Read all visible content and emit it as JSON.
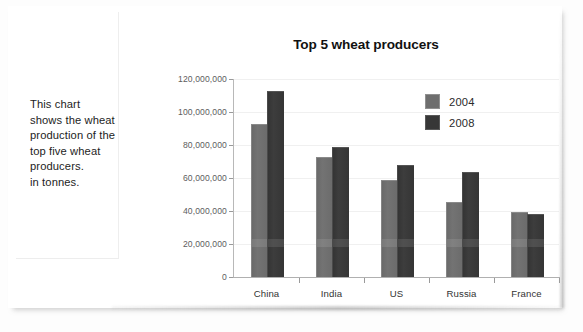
{
  "caption": {
    "text": "This chart\nshows the wheat\nproduction of the\ntop five wheat\nproducers.\nin tonnes."
  },
  "chart_data": {
    "type": "bar",
    "title": "Top 5 wheat producers",
    "xlabel": "",
    "ylabel": "",
    "categories": [
      "China",
      "India",
      "US",
      "Russia",
      "France"
    ],
    "series": [
      {
        "name": "2004",
        "color": "#6e6e6e",
        "values": [
          92000000,
          72000000,
          58000000,
          45000000,
          39000000
        ]
      },
      {
        "name": "2008",
        "color": "#373737",
        "values": [
          112000000,
          78000000,
          67000000,
          63000000,
          37500000
        ]
      }
    ],
    "ylim": [
      0,
      120000000
    ],
    "ytick_values": [
      0,
      20000000,
      40000000,
      60000000,
      80000000,
      100000000,
      120000000
    ],
    "ytick_labels": [
      "0",
      "20,000,000",
      "40,000,000",
      "60,000,000",
      "80,000,000",
      "100,000,000",
      "120,000,000"
    ],
    "grid": true,
    "legend_position": "top-right",
    "legend_entries": [
      "2004",
      "2008"
    ]
  }
}
